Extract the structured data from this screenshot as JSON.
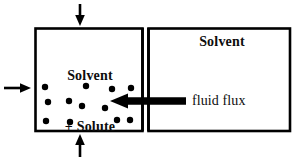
{
  "figure": {
    "type": "osmosis-membrane-diagram",
    "background_color": "#ffffff",
    "stroke_color": "#000000",
    "width": 298,
    "height": 162
  },
  "chambers": {
    "left": {
      "label_line1": "Solvent",
      "label_line2": "+ Solute",
      "label_full": "Solvent + Solute",
      "box": {
        "x": 35,
        "y": 28,
        "width": 107,
        "height": 103
      }
    },
    "right": {
      "label": "Solvent",
      "box": {
        "x": 148,
        "y": 28,
        "width": 142,
        "height": 103
      }
    }
  },
  "membrane": {
    "name": "semipermeable-membrane",
    "x_left_line": 142,
    "x_right_line": 148,
    "y_top": 28,
    "y_bottom": 131
  },
  "flux_arrow": {
    "label": "fluid flux",
    "direction": "left",
    "tip_x": 110,
    "tail_x": 186,
    "y": 101
  },
  "pressure_arrows": [
    {
      "name": "top-pressure-arrow",
      "direction": "down",
      "x": 80,
      "from_y": 4,
      "to_y": 26
    },
    {
      "name": "bottom-pressure-arrow",
      "direction": "up",
      "x": 80,
      "from_y": 157,
      "to_y": 134
    },
    {
      "name": "left-pressure-arrow",
      "direction": "right",
      "y": 88,
      "from_x": 4,
      "to_x": 31
    }
  ],
  "solute_particles": {
    "count": 12,
    "radius": 3.2,
    "color": "#000000",
    "points": [
      [
        45,
        87
      ],
      [
        86,
        86
      ],
      [
        112,
        89
      ],
      [
        131,
        88
      ],
      [
        48,
        102
      ],
      [
        69,
        101
      ],
      [
        105,
        108
      ],
      [
        82,
        106
      ],
      [
        46,
        121
      ],
      [
        70,
        122
      ],
      [
        117,
        120
      ],
      [
        130,
        120
      ]
    ]
  }
}
